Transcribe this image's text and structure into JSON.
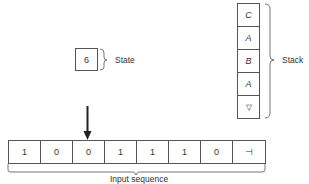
{
  "state": {
    "value": "6",
    "label": "State"
  },
  "stack": {
    "label": "Stack",
    "items": [
      "C",
      "A",
      "B",
      "A",
      "▽"
    ]
  },
  "input": {
    "label": "Input sequence",
    "cells": [
      "1",
      "0",
      "0",
      "1",
      "1",
      "1",
      "0",
      "⊣"
    ],
    "head_position": 2
  },
  "colors": {
    "line": "#555555",
    "arrow": "#222222",
    "text": "#333333"
  }
}
